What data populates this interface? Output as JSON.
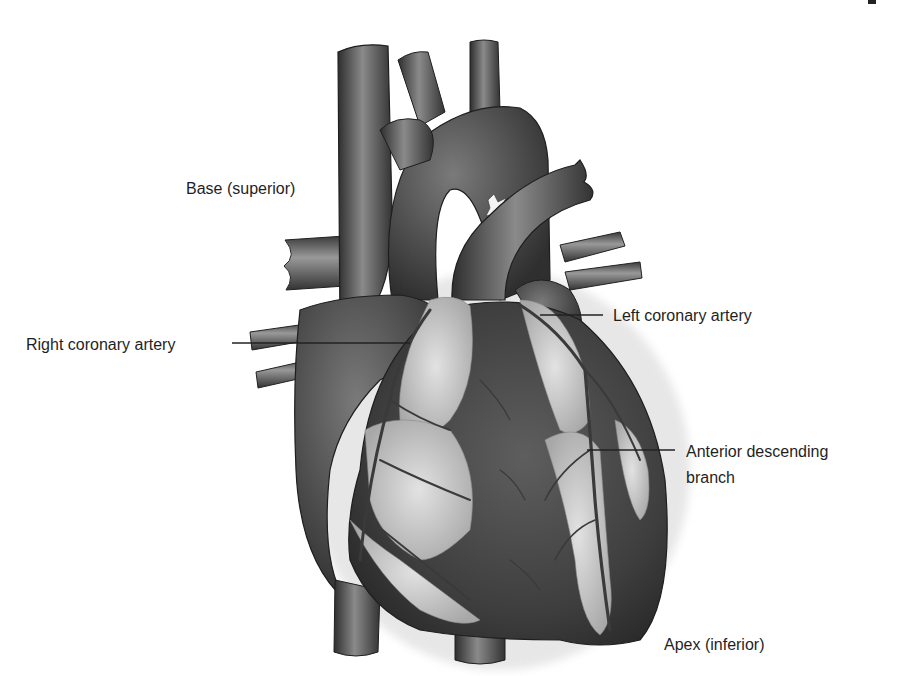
{
  "figure": {
    "labels": {
      "base": "Base (superior)",
      "right_coronary": "Right coronary artery",
      "left_coronary": "Left coronary artery",
      "anterior_descending_line1": "Anterior descending",
      "anterior_descending_line2": "branch",
      "apex": "Apex (inferior)"
    },
    "colors": {
      "background": "#ffffff",
      "text": "#1f1f1f",
      "leader_line": "#222222",
      "vessel_dark": "#3a3a3a",
      "vessel_mid": "#6e6e6e",
      "vessel_light": "#a9a9a9",
      "fat_tissue": "#d6d6d6",
      "myocardium": "#4a4a4a"
    }
  }
}
